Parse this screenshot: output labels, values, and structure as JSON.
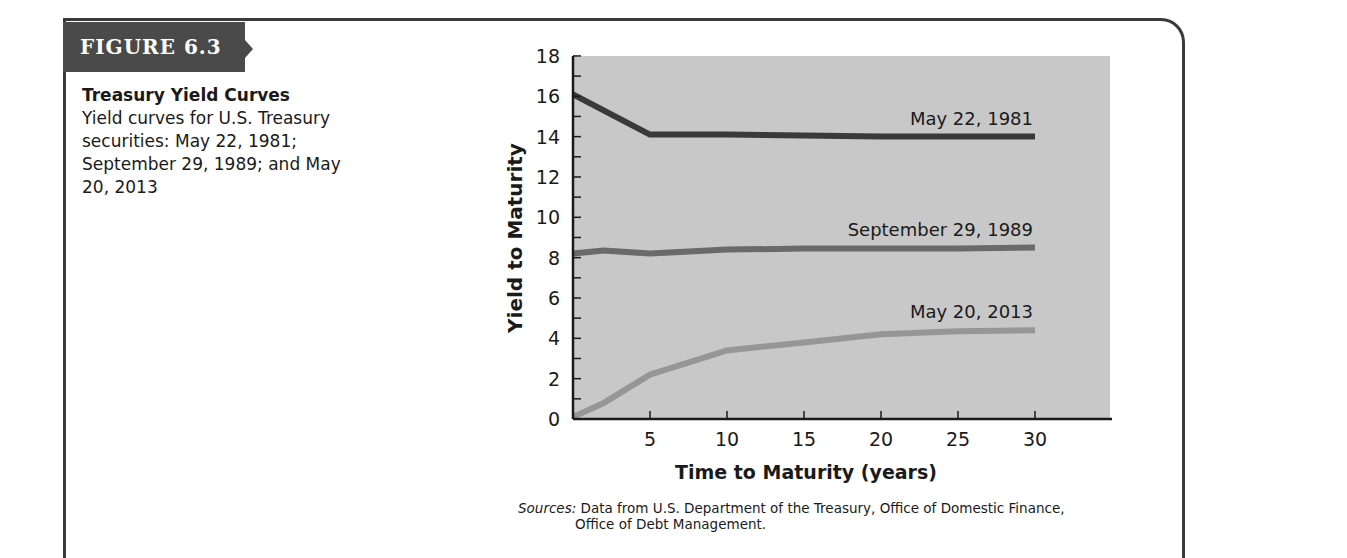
{
  "figure": {
    "label": "FIGURE 6.3",
    "title": "Treasury Yield Curves",
    "description": "Yield curves for U.S. Treasury securities: May 22, 1981; September 29, 1989; and May 20, 2013",
    "sources_label": "Sources:",
    "sources_line1": "Data from U.S. Department of the Treasury, Office of Domestic Finance,",
    "sources_line2": "Office of Debt Management."
  },
  "colors": {
    "plot_background": "#c8c8c8",
    "series_1981": "#3a3a3a",
    "series_1989": "#6a6a6a",
    "series_2013": "#969696",
    "frame": "#3a3a3a",
    "tab": "#4a4a4a"
  },
  "chart_data": {
    "type": "line",
    "title": "Treasury Yield Curves",
    "xlabel": "Time to Maturity (years)",
    "ylabel": "Yield to Maturity",
    "xlim": [
      0,
      32
    ],
    "ylim": [
      0,
      18
    ],
    "xticks": [
      5,
      10,
      15,
      20,
      25,
      30
    ],
    "yticks": [
      0,
      2,
      4,
      6,
      8,
      10,
      12,
      14,
      16,
      18
    ],
    "grid": false,
    "legend_position": "inline labels above each curve, right-aligned",
    "series": [
      {
        "name": "May 22, 1981",
        "x": [
          0,
          5,
          10,
          15,
          20,
          25,
          30
        ],
        "values": [
          16.1,
          14.1,
          14.1,
          14.05,
          14.0,
          14.0,
          14.0
        ]
      },
      {
        "name": "September 29, 1989",
        "x": [
          0,
          2,
          5,
          10,
          15,
          20,
          25,
          30
        ],
        "values": [
          8.2,
          8.35,
          8.2,
          8.4,
          8.45,
          8.45,
          8.45,
          8.5
        ]
      },
      {
        "name": "May 20, 2013",
        "x": [
          0,
          2,
          5,
          10,
          15,
          20,
          25,
          30
        ],
        "values": [
          0.1,
          0.8,
          2.2,
          3.4,
          3.8,
          4.2,
          4.35,
          4.4
        ]
      }
    ]
  }
}
